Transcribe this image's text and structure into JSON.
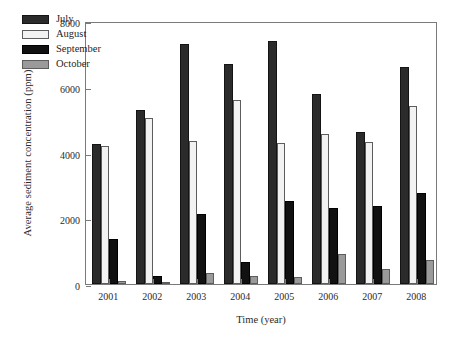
{
  "chart_data": {
    "type": "bar",
    "title": "",
    "xlabel": "Time (year)",
    "ylabel": "Average sediment concentration (ppm)",
    "categories": [
      "2001",
      "2002",
      "2003",
      "2004",
      "2005",
      "2006",
      "2007",
      "2008"
    ],
    "series": [
      {
        "name": "July",
        "color": "#2b2b2b",
        "values": [
          4250,
          5300,
          7300,
          6700,
          7400,
          5780,
          4620,
          6600
        ]
      },
      {
        "name": "August",
        "color": "#f2f2f2",
        "values": [
          4200,
          5050,
          4350,
          5600,
          4280,
          4560,
          4330,
          5400
        ]
      },
      {
        "name": "September",
        "color": "#111111",
        "values": [
          1380,
          250,
          2130,
          680,
          2520,
          2300,
          2380,
          2780
        ]
      },
      {
        "name": "October",
        "color": "#9a9a9a",
        "values": [
          100,
          60,
          340,
          250,
          210,
          900,
          470,
          720
        ]
      }
    ],
    "ylim": [
      0,
      8000
    ],
    "yticks": [
      0,
      2000,
      4000,
      6000,
      8000
    ],
    "ytick_labels": [
      "0",
      "2000",
      "4000",
      "6000",
      "8000"
    ],
    "grid": false,
    "legend_position": "upper left",
    "legend_entries": [
      "July",
      "August",
      "September",
      "October"
    ]
  }
}
